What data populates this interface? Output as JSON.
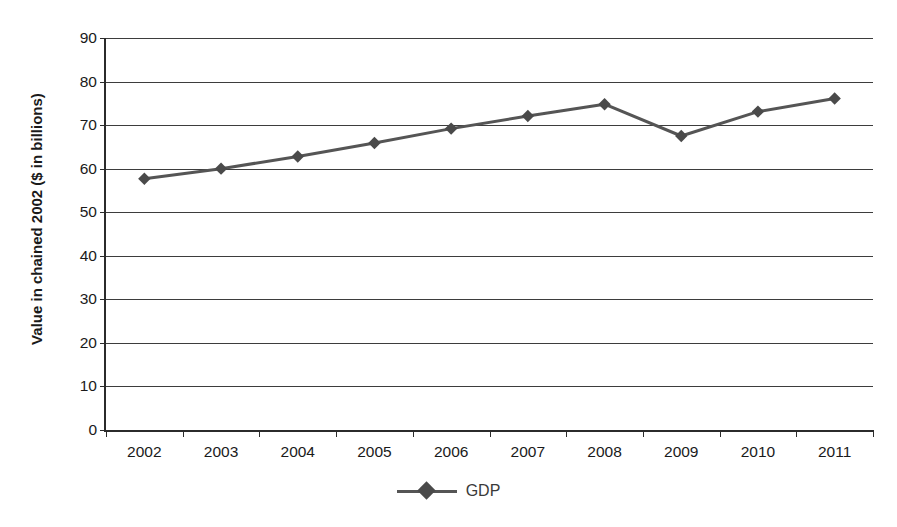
{
  "chart_data": {
    "type": "line",
    "title": "",
    "xlabel": "",
    "ylabel": "Value in chained 2002 ($ in billions)",
    "categories": [
      "2002",
      "2003",
      "2004",
      "2005",
      "2006",
      "2007",
      "2008",
      "2009",
      "2010",
      "2011"
    ],
    "series": [
      {
        "name": "GDP",
        "values": [
          57.7,
          60.0,
          62.8,
          65.9,
          69.2,
          72.1,
          74.8,
          67.5,
          73.1,
          76.1
        ],
        "color": "#555555",
        "marker": "diamond"
      }
    ],
    "ylim": [
      0,
      90
    ],
    "yticks": [
      0,
      10,
      20,
      30,
      40,
      50,
      60,
      70,
      80,
      90
    ],
    "ytick_labels": [
      "0",
      "10",
      "20",
      "30",
      "40",
      "50",
      "60",
      "70",
      "80",
      "90"
    ],
    "grid": "horizontal",
    "legend_position": "bottom-center",
    "legend_entries": [
      "GDP"
    ]
  },
  "axis": {
    "y_title": "Value in chained 2002 ($ in billions)"
  },
  "legend": {
    "label": "GDP"
  },
  "colors": {
    "series": "#555555",
    "marker": "#4a4a4a",
    "grid": "#3d3d3d",
    "axis": "#2b2b2b",
    "background": "#ffffff"
  }
}
